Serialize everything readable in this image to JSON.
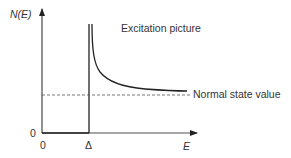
{
  "diagram": {
    "y_axis": {
      "label": "N(E)",
      "origin_label": "0"
    },
    "x_axis": {
      "label": "E",
      "origin_label": "0",
      "gap_label": "Δ"
    },
    "curve_label": "Excitation picture",
    "reference_line_label": "Normal state value",
    "colors": {
      "line": "#222222",
      "text": "#333333",
      "dashed": "#555555"
    }
  }
}
